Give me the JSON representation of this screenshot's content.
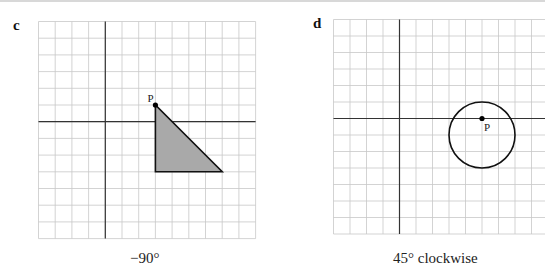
{
  "panels": [
    {
      "id": "c",
      "label": "c",
      "caption": "−90°",
      "grid": {
        "cols": 13,
        "rows": 13,
        "origin_col": 4,
        "origin_row": 6
      },
      "shape": {
        "type": "triangle",
        "vertices": [
          [
            3,
            1
          ],
          [
            3,
            -3
          ],
          [
            7,
            -3
          ]
        ],
        "fill": "#a9a9a9"
      },
      "point": {
        "name": "P",
        "x": 3,
        "y": 1
      }
    },
    {
      "id": "d",
      "label": "d",
      "caption": "45° clockwise",
      "grid": {
        "cols": 13,
        "rows": 13,
        "origin_col": 4,
        "origin_row": 6
      },
      "shape": {
        "type": "circle",
        "center": [
          5,
          -1
        ],
        "radius": 2
      },
      "point": {
        "name": "P",
        "x": 5,
        "y": 0
      }
    }
  ],
  "colors": {
    "grid": "#c8c8c8",
    "axis": "#333333",
    "shape_fill": "#a9a9a9",
    "ink": "#222222"
  }
}
